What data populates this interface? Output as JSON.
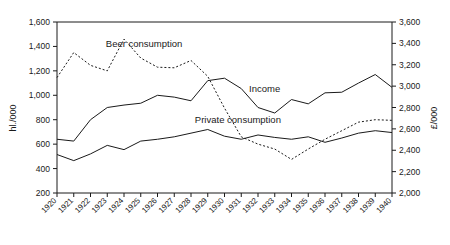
{
  "chart_data": {
    "type": "line",
    "title": "",
    "xlabel": "",
    "ylabel": "hl./000",
    "ylabel_right": "£/000",
    "grid": false,
    "legend_position": "inline-annotations",
    "x": [
      1920,
      1921,
      1922,
      1923,
      1924,
      1925,
      1926,
      1927,
      1928,
      1929,
      1930,
      1931,
      1932,
      1933,
      1934,
      1935,
      1936,
      1937,
      1938,
      1939,
      1940
    ],
    "categories": [
      "1920",
      "1921",
      "1922",
      "1923",
      "1924",
      "1925",
      "1926",
      "1927",
      "1928",
      "1929",
      "1930",
      "1931",
      "1932",
      "1933",
      "1934",
      "1935",
      "1936",
      "1937",
      "1938",
      "1939",
      "1940"
    ],
    "ylim": [
      200,
      1600
    ],
    "yticks": [
      200,
      400,
      600,
      800,
      1000,
      1200,
      1400,
      1600
    ],
    "ytick_labels": [
      "200",
      "400",
      "600",
      "800",
      "1,000",
      "1,200",
      "1,400",
      "1,600"
    ],
    "ylim_right": [
      2000,
      3600
    ],
    "yticks_right": [
      2000,
      2200,
      2400,
      2600,
      2800,
      3000,
      3200,
      3400,
      3600
    ],
    "ytick_labels_right": [
      "2,000",
      "2,200",
      "2,400",
      "2,600",
      "2,800",
      "3,000",
      "3,200",
      "3,400",
      "3,600"
    ],
    "series": [
      {
        "name": "Beer consumption",
        "axis": "left",
        "style": "dashed",
        "label_x": 1925.2,
        "label_y": 1395,
        "values": [
          1145,
          1350,
          1245,
          1200,
          1460,
          1305,
          1230,
          1225,
          1285,
          1155,
          895,
          660,
          600,
          560,
          475,
          560,
          640,
          710,
          780,
          800,
          795
        ]
      },
      {
        "name": "Income",
        "axis": "left",
        "style": "solid",
        "label_x": 1932.4,
        "label_y": 1030,
        "values": [
          640,
          625,
          800,
          900,
          920,
          935,
          1000,
          985,
          955,
          1120,
          1140,
          1055,
          900,
          855,
          965,
          930,
          1020,
          1025,
          1100,
          1170,
          1065
        ]
      },
      {
        "name": "Private consumption",
        "axis": "left",
        "style": "solid",
        "label_x": 1930.8,
        "label_y": 775,
        "values": [
          515,
          465,
          520,
          590,
          555,
          625,
          640,
          660,
          690,
          720,
          665,
          640,
          675,
          655,
          640,
          660,
          615,
          650,
          690,
          710,
          695
        ]
      }
    ]
  },
  "axes": {
    "left_title": "hl./000",
    "right_title": "£/000"
  }
}
